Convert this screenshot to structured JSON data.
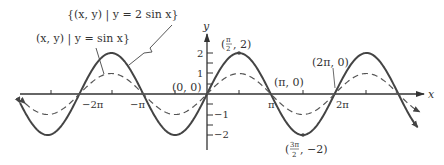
{
  "chart_data": {
    "type": "line",
    "title": "",
    "xlabel": "x",
    "ylabel": "y",
    "xlim": [
      -9.3,
      10.4
    ],
    "ylim": [
      -2.6,
      2.6
    ],
    "grid": false,
    "legend_position": "annotations top-left",
    "x_ticks": [
      {
        "value": -9.4248,
        "label": ""
      },
      {
        "value": -6.2832,
        "label": "−2π"
      },
      {
        "value": -3.1416,
        "label": "−π"
      },
      {
        "value": 1.5708,
        "label": ""
      },
      {
        "value": 3.1416,
        "label": "π"
      },
      {
        "value": 4.7124,
        "label": ""
      },
      {
        "value": 6.2832,
        "label": "2π"
      },
      {
        "value": 7.854,
        "label": ""
      }
    ],
    "y_ticks": [
      {
        "value": 2,
        "label": "2"
      },
      {
        "value": 1.5,
        "label": ""
      },
      {
        "value": 1,
        "label": "1"
      },
      {
        "value": 0.5,
        "label": ""
      },
      {
        "value": -0.5,
        "label": ""
      },
      {
        "value": -1,
        "label": "−1"
      },
      {
        "value": -1.5,
        "label": ""
      },
      {
        "value": -2,
        "label": "−2"
      }
    ],
    "series": [
      {
        "name": "{(x, y) | y = 2 sin x}",
        "function": "2*sin(x)",
        "style": "solid",
        "amplitude": 2,
        "x": [
          -9.42,
          -7.85,
          -6.28,
          -4.71,
          -3.14,
          -1.57,
          0,
          1.57,
          3.14,
          4.71,
          6.28,
          7.85,
          9.42
        ],
        "values": [
          0,
          -2,
          0,
          2,
          0,
          -2,
          0,
          2,
          0,
          -2,
          0,
          2,
          0
        ]
      },
      {
        "name": "(x, y) | y = sin x}",
        "function": "sin(x)",
        "style": "dashed",
        "amplitude": 1,
        "x": [
          -9.42,
          -7.85,
          -6.28,
          -4.71,
          -3.14,
          -1.57,
          0,
          1.57,
          3.14,
          4.71,
          6.28,
          7.85,
          9.42
        ],
        "values": [
          0,
          -1,
          0,
          1,
          0,
          -1,
          0,
          1,
          0,
          -1,
          0,
          1,
          0
        ]
      }
    ],
    "annotations": [
      {
        "text": "(0, 0)",
        "x": 0,
        "y": 0
      },
      {
        "text": "(π/2, 2)",
        "x": 1.5708,
        "y": 2
      },
      {
        "text": "(π, 0)",
        "x": 3.1416,
        "y": 0
      },
      {
        "text": "(2π, 0)",
        "x": 6.2832,
        "y": 0
      },
      {
        "text": "(3π/2, −2)",
        "x": 4.7124,
        "y": -2
      }
    ]
  },
  "labels": {
    "axis_x": "x",
    "axis_y": "y",
    "legend_2sin": "{(x, y) | y = 2 sin x}",
    "legend_sin": "(x, y) | y = sin x}",
    "tick_neg2pi": "−2π",
    "tick_negpi": "−π",
    "tick_pi": "π",
    "tick_2pi": "2π",
    "ytick_2": "2",
    "ytick_1": "1",
    "ytick_neg1": "−1",
    "ytick_neg2": "−2",
    "pt_origin": "(0, 0)",
    "pt_pi": "(π, 0)",
    "pt_2pi": "(2π, 0)",
    "pt_max_open": "(",
    "pt_max_num": "π",
    "pt_max_den": "2",
    "pt_max_rest": ", 2)",
    "pt_min_open": "(",
    "pt_min_num": "3π",
    "pt_min_den": "2",
    "pt_min_rest": ", −2)"
  },
  "style": {
    "curve_color": "#444444",
    "axis_color": "#333333"
  }
}
